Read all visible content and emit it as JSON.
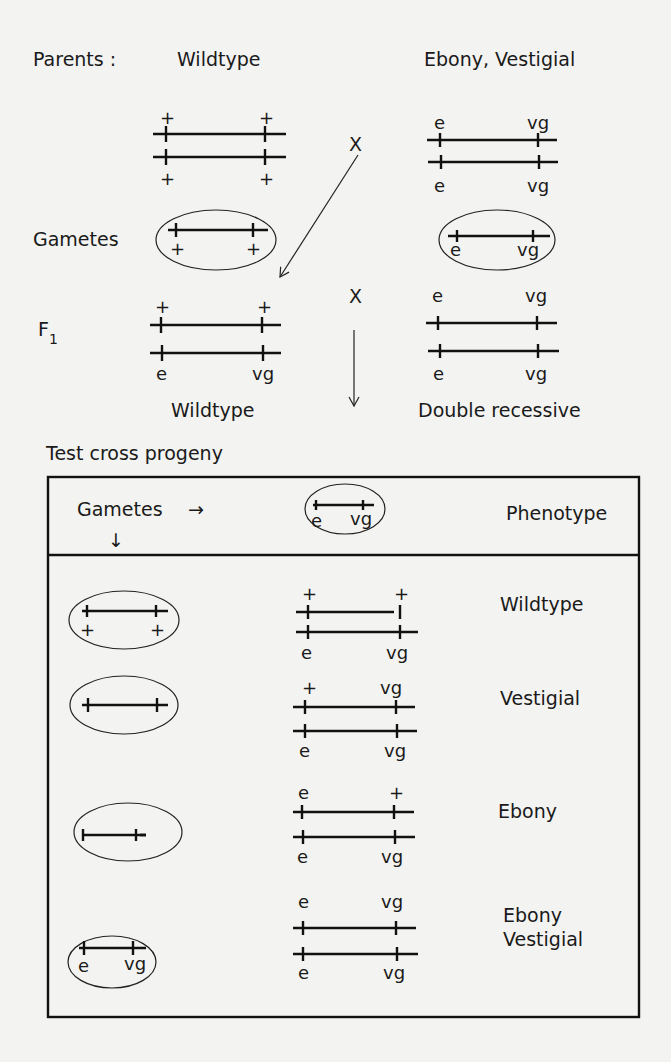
{
  "parents": {
    "label": "Parents :",
    "wildtype": {
      "title": "Wildtype",
      "top_alleles": [
        "+",
        "+"
      ],
      "bottom_alleles": [
        "+",
        "+"
      ]
    },
    "mutant": {
      "title": "Ebony, Vestigial",
      "top_alleles": [
        "e",
        "vg"
      ],
      "bottom_alleles": [
        "e",
        "vg"
      ]
    },
    "cross_symbol": "X"
  },
  "gametes": {
    "label": "Gametes",
    "wildtype_alleles": [
      "+",
      "+"
    ],
    "mutant_alleles": [
      "e",
      "vg"
    ]
  },
  "f1": {
    "label": "F",
    "subscript": "1",
    "top_alleles": [
      "+",
      "+"
    ],
    "bottom_alleles": [
      "e",
      "vg"
    ],
    "caption": "Wildtype",
    "cross_symbol": "X",
    "partner": {
      "top_alleles": [
        "e",
        "vg"
      ],
      "bottom_alleles": [
        "e",
        "vg"
      ],
      "caption": "Double recessive"
    }
  },
  "test_cross": {
    "title": "Test cross progeny",
    "header": {
      "gametes_label": "Gametes",
      "right_arrow": "→",
      "down_arrow": "↓",
      "gamete_alleles": [
        "e",
        "vg"
      ],
      "phenotype_label": "Phenotype"
    },
    "rows": [
      {
        "gamete_alleles": [
          "+",
          "+"
        ],
        "top_alleles": [
          "+",
          "+"
        ],
        "bottom_alleles": [
          "e",
          "vg"
        ],
        "phenotype": "Wildtype"
      },
      {
        "gamete_alleles": [
          "",
          ""
        ],
        "top_alleles": [
          "+",
          "vg"
        ],
        "bottom_alleles": [
          "e",
          "vg"
        ],
        "phenotype": "Vestigial"
      },
      {
        "gamete_alleles": [
          "",
          ""
        ],
        "top_alleles": [
          "e",
          "+"
        ],
        "bottom_alleles": [
          "e",
          "vg"
        ],
        "phenotype": "Ebony"
      },
      {
        "gamete_alleles": [
          "e",
          "vg"
        ],
        "top_alleles": [
          "e",
          "vg"
        ],
        "bottom_alleles": [
          "e",
          "vg"
        ],
        "phenotype_line1": "Ebony",
        "phenotype_line2": "Vestigial"
      }
    ]
  }
}
